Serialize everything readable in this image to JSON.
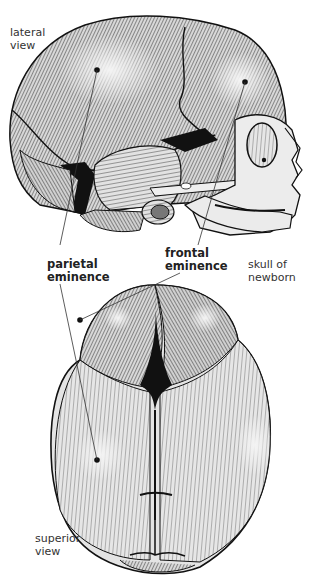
{
  "figure": {
    "labels": {
      "lateral_view": "lateral\nview",
      "parietal_eminence": "parietal\neminence",
      "frontal_eminence": "frontal\neminence",
      "skull_of_newborn": "skull of\nnewborn",
      "superior_view": "superior\nview"
    },
    "views": [
      "lateral view",
      "superior view"
    ],
    "colors": {
      "ink": "#111111",
      "bone": "#e6e6e6",
      "shade": "#9a9a9a",
      "fontanelle": "#111111",
      "background": "#ffffff"
    }
  }
}
